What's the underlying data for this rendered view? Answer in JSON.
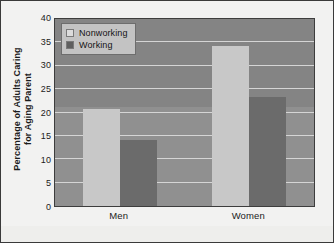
{
  "chart_data": {
    "type": "bar",
    "title": "",
    "subtitle": "",
    "xlabel": "",
    "ylabel": "Percentage of Adults Caring for Aging Parent",
    "ylabel_line1": "Percentage of Adults Caring",
    "ylabel_line2": "for Aging Parent",
    "categories": [
      "Men",
      "Women"
    ],
    "series": [
      {
        "name": "Nonworking",
        "values": [
          20.8,
          34.2
        ],
        "color": "#c8c8c8"
      },
      {
        "name": "Working",
        "values": [
          14.1,
          23.3
        ],
        "color": "#6b6b6b"
      }
    ],
    "ylim": [
      0,
      40
    ],
    "yticks": [
      0,
      5,
      10,
      15,
      20,
      25,
      30,
      35,
      40
    ],
    "ytick_labels": [
      "0",
      "5",
      "10",
      "15",
      "20",
      "25",
      "30",
      "35",
      "40"
    ],
    "grid": true,
    "grid_axis": "y",
    "legend": {
      "position": "top-left-inside",
      "entries": [
        {
          "label": "Nonworking",
          "swatch": "#dcdcdc"
        },
        {
          "label": "Working",
          "swatch": "#5f5f5f"
        }
      ]
    },
    "plot_background": "#909090",
    "figure_background": "#f2f2f1",
    "gridline_color": "#d5d5d5",
    "border_color": "#3d3d3d"
  }
}
